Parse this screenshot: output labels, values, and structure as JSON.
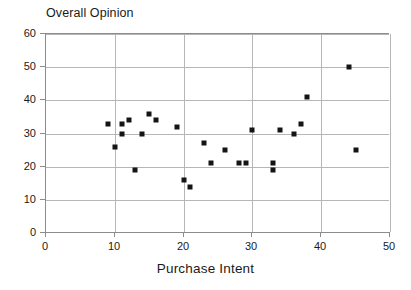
{
  "chart_data": {
    "type": "scatter",
    "title": "Overall Opinion",
    "xlabel": "Purchase Intent",
    "ylabel": "",
    "xlim": [
      0,
      50
    ],
    "ylim": [
      0,
      60
    ],
    "xticks": [
      0,
      10,
      20,
      30,
      40,
      50
    ],
    "yticks": [
      0,
      10,
      20,
      30,
      40,
      50,
      60
    ],
    "xtick_labels": [
      "0",
      "10",
      "20",
      "30",
      "40",
      "50"
    ],
    "ytick_labels": [
      "0",
      "10",
      "20",
      "30",
      "40",
      "50",
      "60"
    ],
    "grid": true,
    "legend": null,
    "marker": {
      "shape": "square",
      "color": "#141414",
      "size_px": 5
    },
    "points": [
      {
        "x": 9,
        "y": 33
      },
      {
        "x": 10,
        "y": 26
      },
      {
        "x": 11,
        "y": 33
      },
      {
        "x": 11,
        "y": 30
      },
      {
        "x": 12,
        "y": 34
      },
      {
        "x": 13,
        "y": 19
      },
      {
        "x": 14,
        "y": 30
      },
      {
        "x": 15,
        "y": 36
      },
      {
        "x": 16,
        "y": 34
      },
      {
        "x": 19,
        "y": 32
      },
      {
        "x": 20,
        "y": 16
      },
      {
        "x": 21,
        "y": 14
      },
      {
        "x": 23,
        "y": 27
      },
      {
        "x": 24,
        "y": 21
      },
      {
        "x": 26,
        "y": 25
      },
      {
        "x": 28,
        "y": 21
      },
      {
        "x": 29,
        "y": 21
      },
      {
        "x": 30,
        "y": 31
      },
      {
        "x": 33,
        "y": 21
      },
      {
        "x": 33,
        "y": 19
      },
      {
        "x": 34,
        "y": 31
      },
      {
        "x": 36,
        "y": 30
      },
      {
        "x": 37,
        "y": 33
      },
      {
        "x": 38,
        "y": 41
      },
      {
        "x": 44,
        "y": 50
      },
      {
        "x": 45,
        "y": 25
      }
    ]
  },
  "colors": {
    "marker": "#141414",
    "gridline": "#b6b6b6",
    "axis": "#8c8c8c",
    "text": "#1a1a1a",
    "background": "#ffffff"
  }
}
